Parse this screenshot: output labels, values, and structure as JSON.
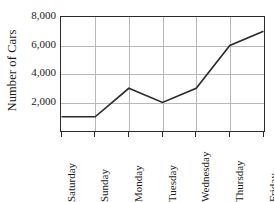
{
  "chart_data": {
    "type": "line",
    "title": "",
    "xlabel": "",
    "ylabel": "Number of Cars",
    "categories": [
      "Saturday",
      "Sunday",
      "Monday",
      "Tuesday",
      "Wednesday",
      "Thursday",
      "Friday"
    ],
    "values": [
      1000,
      1000,
      3000,
      2000,
      3000,
      6000,
      7000
    ],
    "series": [
      {
        "name": "Number of Cars",
        "values": [
          1000,
          1000,
          3000,
          2000,
          3000,
          6000,
          7000
        ]
      }
    ],
    "ylim": [
      0,
      8000
    ],
    "y_ticks": [
      2000,
      4000,
      6000,
      8000
    ],
    "y_tick_labels": [
      "2,000",
      "4,000",
      "6,000",
      "8,000"
    ],
    "grid": true,
    "grid_axis": "both",
    "legend": false,
    "legend_position": "none",
    "markers": false,
    "line_color": "#2b2b2b",
    "grid_color": "#b8b8b8",
    "axis_color": "#2b2b2b",
    "background_color": "#ffffff"
  },
  "axes": {
    "y_title": "Number of Cars"
  }
}
